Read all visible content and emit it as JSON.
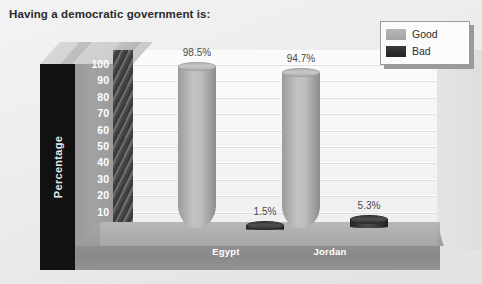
{
  "title": "Having a democratic government is:",
  "legend": {
    "position": "top-right",
    "entries": [
      {
        "label": "Good",
        "color": "#a9a9a9",
        "icon": "legend-swatch"
      },
      {
        "label": "Bad",
        "color": "#2b2b2b",
        "icon": "legend-swatch"
      }
    ]
  },
  "axis": {
    "ylabel": "Percentage",
    "yticks": [
      "100",
      "90",
      "80",
      "70",
      "60",
      "50",
      "40",
      "30",
      "20",
      "10",
      "0"
    ]
  },
  "chart_data": {
    "type": "bar",
    "title": "Having a democratic government is:",
    "xlabel": "",
    "ylabel": "Percentage",
    "ylim": [
      0,
      100
    ],
    "ytick_step": 10,
    "grid": true,
    "legend_position": "top-right",
    "style": "3d-cylinder",
    "categories": [
      "Egypt",
      "Jordan"
    ],
    "series": [
      {
        "name": "Good",
        "color": "#a9a9a9",
        "values": [
          98.5,
          94.7
        ],
        "labels": [
          "98.5%",
          "94.7%"
        ]
      },
      {
        "name": "Bad",
        "color": "#2b2b2b",
        "values": [
          1.5,
          5.3
        ],
        "labels": [
          "1.5%",
          "5.3%"
        ]
      }
    ]
  }
}
